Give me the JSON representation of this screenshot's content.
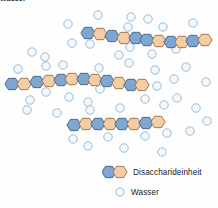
{
  "figure": {
    "clipped_top_caption": "Wasser",
    "colors": {
      "hex_blue_fill": "#7da7d0",
      "hex_blue_stroke": "#3f5f85",
      "hex_orange_fill": "#f3cda3",
      "hex_orange_stroke": "#9b6c3e",
      "water_fill": "#f4f8fb",
      "water_stroke": "#8fb4cf",
      "background": "#fefefe",
      "text": "#1a1a1a"
    }
  },
  "legend": {
    "items": [
      {
        "id": "disaccharide",
        "label": "Disaccharideinheit",
        "swatch_type": "hexagon-pair",
        "swatch_colors": [
          "#7da7d0",
          "#f3cda3"
        ]
      },
      {
        "id": "wasser",
        "label": "Wasser",
        "swatch_type": "circle",
        "swatch_colors": [
          "#f4f8fb"
        ]
      }
    ]
  },
  "chart_data": {
    "type": "scatter",
    "title": "",
    "subtitle": "",
    "xlabel": "",
    "ylabel": "",
    "grid": false,
    "legend_position": "bottom-right",
    "xlim": [
      0,
      218
    ],
    "ylim": [
      0,
      208
    ],
    "annotations": [
      "Wasser"
    ],
    "series": [
      {
        "name": "Disaccharideinheit",
        "kind": "polysaccharide-chains",
        "chains": [
          {
            "id": "chain-top",
            "unit_count": 12,
            "hexagons": [
              {
                "x": 88,
                "y": 33,
                "color": "blue"
              },
              {
                "x": 100,
                "y": 34,
                "color": "orange"
              },
              {
                "x": 112,
                "y": 36,
                "color": "blue"
              },
              {
                "x": 124,
                "y": 38,
                "color": "orange"
              },
              {
                "x": 136,
                "y": 38,
                "color": "blue"
              },
              {
                "x": 147,
                "y": 40,
                "color": "blue"
              },
              {
                "x": 159,
                "y": 41,
                "color": "orange"
              },
              {
                "x": 171,
                "y": 42,
                "color": "blue"
              },
              {
                "x": 182,
                "y": 42,
                "color": "orange"
              },
              {
                "x": 193,
                "y": 41,
                "color": "blue"
              },
              {
                "x": 205,
                "y": 40,
                "color": "orange"
              }
            ]
          },
          {
            "id": "chain-middle",
            "unit_count": 12,
            "hexagons": [
              {
                "x": 12,
                "y": 84,
                "color": "blue"
              },
              {
                "x": 24,
                "y": 84,
                "color": "orange"
              },
              {
                "x": 37,
                "y": 82,
                "color": "blue"
              },
              {
                "x": 49,
                "y": 81,
                "color": "orange"
              },
              {
                "x": 61,
                "y": 80,
                "color": "blue"
              },
              {
                "x": 72,
                "y": 79,
                "color": "orange"
              },
              {
                "x": 84,
                "y": 79,
                "color": "blue"
              },
              {
                "x": 95,
                "y": 80,
                "color": "orange"
              },
              {
                "x": 107,
                "y": 81,
                "color": "blue"
              },
              {
                "x": 119,
                "y": 83,
                "color": "orange"
              },
              {
                "x": 131,
                "y": 85,
                "color": "blue"
              },
              {
                "x": 142,
                "y": 85,
                "color": "orange"
              }
            ]
          },
          {
            "id": "chain-bottom",
            "unit_count": 8,
            "hexagons": [
              {
                "x": 74,
                "y": 125,
                "color": "blue"
              },
              {
                "x": 86,
                "y": 124,
                "color": "orange"
              },
              {
                "x": 98,
                "y": 124,
                "color": "blue"
              },
              {
                "x": 110,
                "y": 124,
                "color": "orange"
              },
              {
                "x": 122,
                "y": 124,
                "color": "blue"
              },
              {
                "x": 134,
                "y": 124,
                "color": "orange"
              },
              {
                "x": 146,
                "y": 123,
                "color": "blue"
              },
              {
                "x": 158,
                "y": 122,
                "color": "orange"
              }
            ]
          }
        ]
      },
      {
        "name": "Wasser",
        "kind": "water-molecules",
        "radius": 4.2,
        "points": [
          {
            "x": 98,
            "y": 15
          },
          {
            "x": 68,
            "y": 24
          },
          {
            "x": 131,
            "y": 17
          },
          {
            "x": 148,
            "y": 19
          },
          {
            "x": 193,
            "y": 23
          },
          {
            "x": 72,
            "y": 43
          },
          {
            "x": 90,
            "y": 44
          },
          {
            "x": 128,
            "y": 27
          },
          {
            "x": 130,
            "y": 47
          },
          {
            "x": 163,
            "y": 27
          },
          {
            "x": 176,
            "y": 49
          },
          {
            "x": 119,
            "y": 55
          },
          {
            "x": 152,
            "y": 54
          },
          {
            "x": 32,
            "y": 52
          },
          {
            "x": 45,
            "y": 57
          },
          {
            "x": 18,
            "y": 69
          },
          {
            "x": 46,
            "y": 66
          },
          {
            "x": 63,
            "y": 65
          },
          {
            "x": 99,
            "y": 68
          },
          {
            "x": 129,
            "y": 63
          },
          {
            "x": 155,
            "y": 70
          },
          {
            "x": 100,
            "y": 89
          },
          {
            "x": 46,
            "y": 92
          },
          {
            "x": 157,
            "y": 86
          },
          {
            "x": 174,
            "y": 79
          },
          {
            "x": 186,
            "y": 67
          },
          {
            "x": 206,
            "y": 82
          },
          {
            "x": 30,
            "y": 100
          },
          {
            "x": 69,
            "y": 97
          },
          {
            "x": 88,
            "y": 102
          },
          {
            "x": 145,
            "y": 99
          },
          {
            "x": 27,
            "y": 110
          },
          {
            "x": 57,
            "y": 113
          },
          {
            "x": 120,
            "y": 108
          },
          {
            "x": 90,
            "y": 110
          },
          {
            "x": 164,
            "y": 105
          },
          {
            "x": 177,
            "y": 98
          },
          {
            "x": 196,
            "y": 108
          },
          {
            "x": 73,
            "y": 139
          },
          {
            "x": 108,
            "y": 137
          },
          {
            "x": 145,
            "y": 136
          },
          {
            "x": 167,
            "y": 133
          },
          {
            "x": 88,
            "y": 146
          },
          {
            "x": 124,
            "y": 148
          },
          {
            "x": 190,
            "y": 131
          },
          {
            "x": 162,
            "y": 152
          },
          {
            "x": 207,
            "y": 121
          }
        ]
      }
    ]
  }
}
